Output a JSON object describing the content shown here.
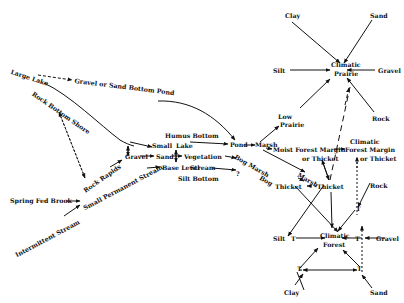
{
  "diagram": {
    "title": "",
    "nodes": {
      "large_lake": "Large Lake",
      "gravel_sand_pond": "Gravel or Sand Bottom Pond",
      "rock_bottom_shore": "Rock Bottom Shore",
      "rock_rapids": "Rock Rapids",
      "gravel": "Gravel",
      "small_lake_small": "Small",
      "sand": "Sand",
      "humus_bottom": "Humus Bottom",
      "lake": "Lake",
      "vegetation": "Vegetation",
      "base_level": "Base Level",
      "stream": "Stream",
      "silt_bottom": "Silt Bottom",
      "question": "?",
      "small_permanent_stream": "Small Permanent Stream",
      "spring_fed_brook": "Spring Fed Brook",
      "intermittent_stream": "Intermittent Stream",
      "pond": "Pond",
      "marsh1": "Marsh",
      "bog_marsh": "Bog Marsh",
      "bog": "Bog",
      "thicket_left": "Thicket",
      "marsh2": "Marsh",
      "thicket_mid": "Thicket",
      "low": "Low",
      "prairie_low": "Prairie",
      "moist_forest_margin": "Moist Forest Margin",
      "or_thicket1": "or Thicket",
      "climatic_fm": "Climatic",
      "forest_margin": "Forest Margin",
      "or_thicket2": "or Thicket",
      "clay_top": "Clay",
      "sand_top": "Sand",
      "silt_top": "Silt",
      "gravel_top": "Gravel",
      "rock_top": "Rock",
      "climatic_prairie_1": "Climatic",
      "climatic_prairie_2": "Prairie",
      "rock_bottom": "Rock",
      "silt_bottom_right": "Silt",
      "gravel_bottom_right": "Gravel",
      "clay_bottom": "Clay",
      "sand_bottom": "Sand",
      "climatic_forest_1": "Climatic",
      "climatic_forest_2": "Forest",
      "t": "T"
    }
  }
}
